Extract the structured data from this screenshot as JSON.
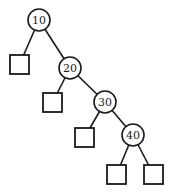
{
  "diagram": {
    "type": "binary-search-tree",
    "stroke_color": "#1a1a1a",
    "fill_color": "#ffffff",
    "nodes": [
      {
        "id": "n10",
        "label": "10",
        "cx": 39,
        "cy": 20,
        "r": 11
      },
      {
        "id": "n20",
        "label": "20",
        "cx": 70,
        "cy": 68,
        "r": 11
      },
      {
        "id": "n30",
        "label": "30",
        "cx": 105,
        "cy": 102,
        "r": 11
      },
      {
        "id": "n40",
        "label": "40",
        "cx": 133,
        "cy": 135,
        "r": 11
      }
    ],
    "leaves": [
      {
        "id": "l1",
        "x": 10,
        "y": 55,
        "size": 19
      },
      {
        "id": "l2",
        "x": 43,
        "y": 93,
        "size": 19
      },
      {
        "id": "l3",
        "x": 75,
        "y": 128,
        "size": 19
      },
      {
        "id": "l4",
        "x": 107,
        "y": 165,
        "size": 19
      },
      {
        "id": "l5",
        "x": 144,
        "y": 165,
        "size": 19
      }
    ],
    "edges": [
      {
        "from": "n10",
        "to": "l1"
      },
      {
        "from": "n10",
        "to": "n20"
      },
      {
        "from": "n20",
        "to": "l2"
      },
      {
        "from": "n20",
        "to": "n30"
      },
      {
        "from": "n30",
        "to": "l3"
      },
      {
        "from": "n30",
        "to": "n40"
      },
      {
        "from": "n40",
        "to": "l4"
      },
      {
        "from": "n40",
        "to": "l5"
      }
    ]
  }
}
